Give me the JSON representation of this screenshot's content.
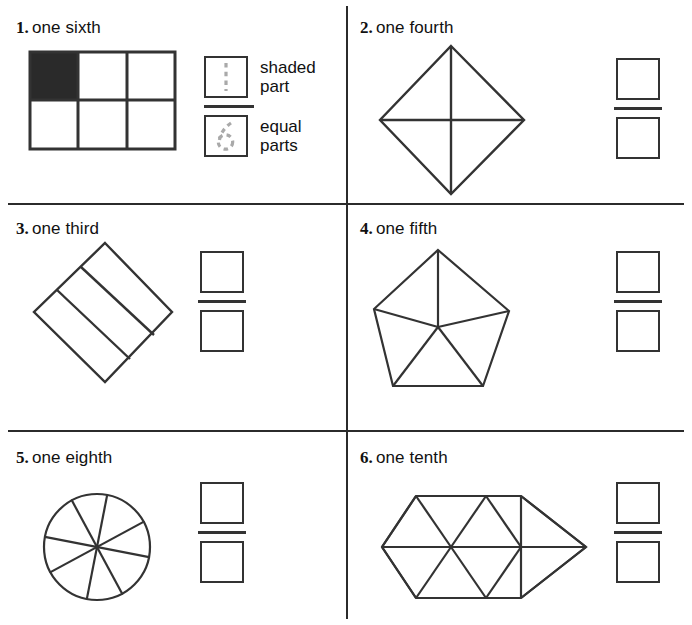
{
  "worksheet": {
    "title": "Fractions: shaded part over equal parts",
    "legend": {
      "numerator_label": "shaded\npart",
      "denominator_label": "equal\nparts",
      "numerator_value": "1",
      "denominator_value": "6",
      "numerator_icon": "dashed-one-numeral",
      "denominator_icon": "dashed-six-numeral"
    },
    "colors": {
      "ink": "#2b2b2b",
      "shape_stroke": "#333333",
      "shaded_fill": "#2a2a2a",
      "ghost_numeral": "#a9a9a9",
      "page": "#ffffff"
    },
    "problems": [
      {
        "number": "1.",
        "word": "one sixth",
        "figure": "rectangle-3x2-grid",
        "shaded_parts": 1,
        "equal_parts": 6,
        "answer_numerator": "",
        "answer_denominator": ""
      },
      {
        "number": "2.",
        "word": "one fourth",
        "figure": "diamond-quartered",
        "shaded_parts": 0,
        "equal_parts": 4,
        "answer_numerator": "",
        "answer_denominator": ""
      },
      {
        "number": "3.",
        "word": "one third",
        "figure": "diamond-three-strips",
        "shaded_parts": 0,
        "equal_parts": 3,
        "answer_numerator": "",
        "answer_denominator": ""
      },
      {
        "number": "4.",
        "word": "one fifth",
        "figure": "pentagon-five-sectors",
        "shaded_parts": 0,
        "equal_parts": 5,
        "answer_numerator": "",
        "answer_denominator": ""
      },
      {
        "number": "5.",
        "word": "one eighth",
        "figure": "circle-eight-sectors",
        "shaded_parts": 0,
        "equal_parts": 8,
        "answer_numerator": "",
        "answer_denominator": ""
      },
      {
        "number": "6.",
        "word": "one tenth",
        "figure": "hexagon-ten-triangles",
        "shaded_parts": 0,
        "equal_parts": 10,
        "answer_numerator": "",
        "answer_denominator": ""
      }
    ]
  }
}
